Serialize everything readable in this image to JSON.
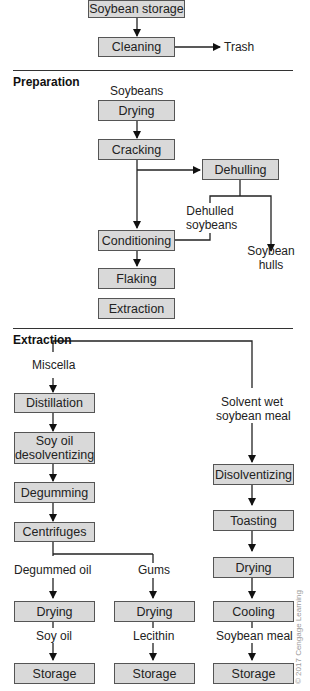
{
  "top": {
    "boxes": {
      "soybean_storage": "Soybean storage",
      "cleaning": "Cleaning"
    },
    "labels": {
      "trash": "Trash"
    }
  },
  "preparation": {
    "title": "Preparation",
    "labels": {
      "soybeans": "Soybeans",
      "dehulled_soybeans_1": "Dehulled",
      "dehulled_soybeans_2": "soybeans",
      "hulls_1": "Soybean",
      "hulls_2": "hulls"
    },
    "boxes": {
      "drying": "Drying",
      "cracking": "Cracking",
      "dehulling": "Dehulling",
      "conditioning": "Conditioning",
      "flaking": "Flaking",
      "extraction": "Extraction"
    }
  },
  "extraction": {
    "title": "Extraction",
    "labels": {
      "miscella": "Miscella",
      "solvent_wet_1": "Solvent wet",
      "solvent_wet_2": "soybean meal",
      "degummed_oil": "Degummed oil",
      "gums": "Gums",
      "soy_oil": "Soy oil",
      "lecithin": "Lecithin",
      "soybean_meal": "Soybean meal"
    },
    "oil_branch": {
      "distillation": "Distillation",
      "soy_oil_desolv_1": "Soy oil",
      "soy_oil_desolv_2": "desolventizing",
      "degumming": "Degumming",
      "centrifuges": "Centrifuges",
      "drying": "Drying",
      "storage": "Storage"
    },
    "gums_branch": {
      "drying": "Drying",
      "storage": "Storage"
    },
    "meal_branch": {
      "disolventizing": "Disolventizing",
      "toasting": "Toasting",
      "drying": "Drying",
      "cooling": "Cooling",
      "storage": "Storage"
    }
  },
  "credit": "© 2017 Cengage Learning"
}
